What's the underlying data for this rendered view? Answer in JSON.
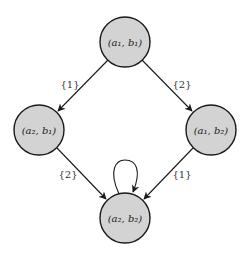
{
  "diagram": {
    "type": "state-transition-graph",
    "nodes": [
      {
        "id": "n11",
        "label": "(a₁, b₁)",
        "cx": 125,
        "cy": 42
      },
      {
        "id": "n21",
        "label": "(a₂, b₁)",
        "cx": 39,
        "cy": 130
      },
      {
        "id": "n12",
        "label": "(a₁, b₂)",
        "cx": 211,
        "cy": 130
      },
      {
        "id": "n22",
        "label": "(a₂, b₂)",
        "cx": 125,
        "cy": 218
      }
    ],
    "edges": [
      {
        "from": "n11",
        "to": "n21",
        "label": "{1}"
      },
      {
        "from": "n11",
        "to": "n12",
        "label": "{2}"
      },
      {
        "from": "n21",
        "to": "n22",
        "label": "{2}"
      },
      {
        "from": "n12",
        "to": "n22",
        "label": "{1}"
      },
      {
        "from": "n22",
        "to": "n22",
        "label": ""
      }
    ],
    "colors": {
      "node_fill": "#d3d3d3",
      "stroke": "#1a1a1a"
    }
  }
}
